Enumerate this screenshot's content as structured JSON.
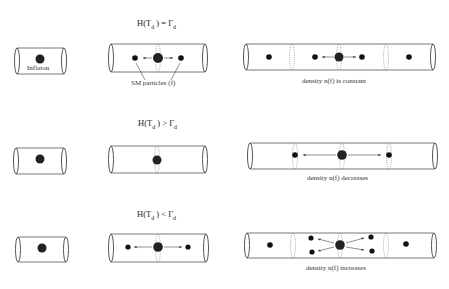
{
  "diagram": {
    "rows": [
      {
        "condition": {
          "lhs": "H(T",
          "sub1": "d",
          "mid": " ) = ",
          "rhs": "Γ",
          "sub2": "d"
        },
        "right_caption": "density n(f) is constant"
      },
      {
        "condition": {
          "lhs": "H(T",
          "sub1": "d",
          "mid": " ) > ",
          "rhs": "Γ",
          "sub2": "d"
        },
        "right_caption": "density n(f) decreases"
      },
      {
        "condition": {
          "lhs": "H(T",
          "sub1": "d",
          "mid": " ) < ",
          "rhs": "Γ",
          "sub2": "d"
        },
        "right_caption": "density n(f) increases"
      }
    ],
    "labels": {
      "inflaton": "Inflaton",
      "sm_particles": "SM particles (f)"
    },
    "colors": {
      "line": "#444444",
      "particle": "#111111",
      "inflaton": "#222222"
    }
  }
}
